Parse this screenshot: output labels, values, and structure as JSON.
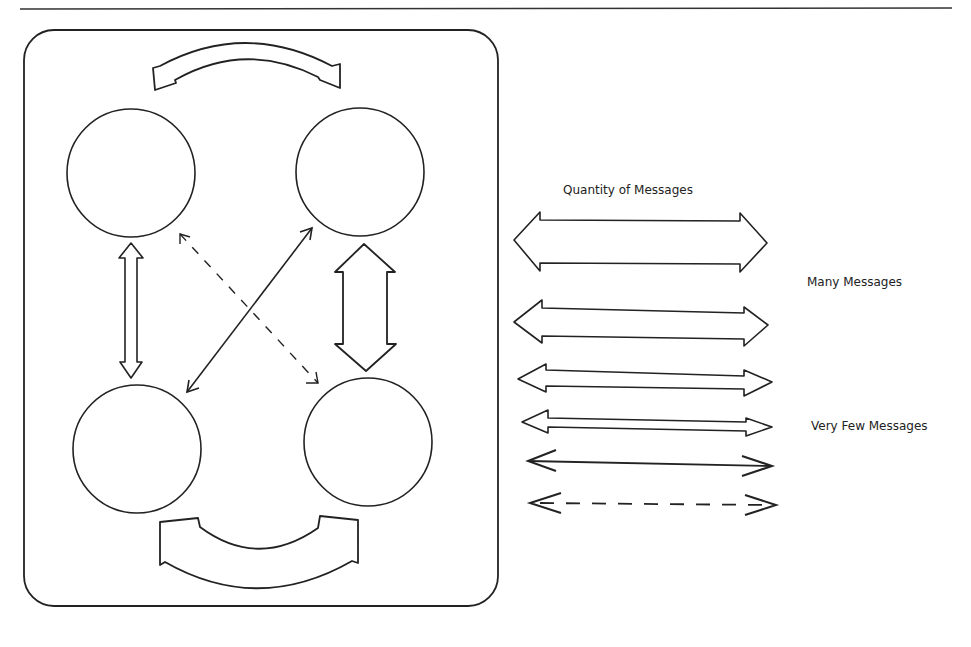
{
  "diagram": {
    "nodes": [
      {
        "id": "top-left",
        "label": ""
      },
      {
        "id": "top-right",
        "label": ""
      },
      {
        "id": "bottom-left",
        "label": ""
      },
      {
        "id": "bottom-right",
        "label": ""
      }
    ],
    "connections": [
      {
        "from": "top-left",
        "to": "top-right",
        "weight": "many",
        "style": "curved-wide"
      },
      {
        "from": "bottom-left",
        "to": "bottom-right",
        "weight": "many",
        "style": "curved-wide"
      },
      {
        "from": "top-left",
        "to": "bottom-left",
        "weight": "few",
        "style": "narrow-double"
      },
      {
        "from": "top-right",
        "to": "bottom-right",
        "weight": "many",
        "style": "wide-double"
      },
      {
        "from": "top-right",
        "to": "bottom-left",
        "weight": "very-few",
        "style": "single-line"
      },
      {
        "from": "top-left",
        "to": "bottom-right",
        "weight": "minimal",
        "style": "dashed"
      }
    ]
  },
  "legend": {
    "title": "Quantity of Messages",
    "many_label": "Many Messages",
    "few_label": "Very Few Messages",
    "scale": [
      "widest",
      "wide",
      "medium",
      "narrow",
      "single",
      "dashed"
    ]
  }
}
